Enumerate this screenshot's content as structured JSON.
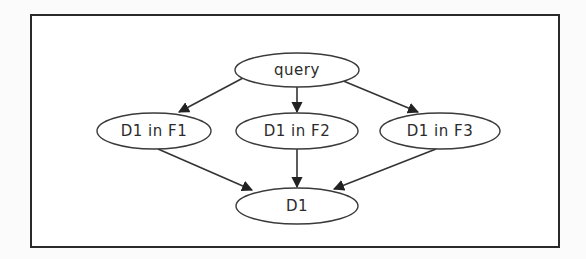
{
  "diagram": {
    "type": "directed-graph",
    "colors": {
      "frame": "#2a2a2a",
      "node_stroke": "#3a3a3a",
      "edge": "#333333",
      "text": "#2b2b2b",
      "background": "#ffffff"
    },
    "nodes": [
      {
        "id": "query",
        "label": "query",
        "cx": 297,
        "cy": 70,
        "rx": 62,
        "ry": 17
      },
      {
        "id": "d1_f1",
        "label": "D1 in F1",
        "cx": 154,
        "cy": 131,
        "rx": 57,
        "ry": 18
      },
      {
        "id": "d1_f2",
        "label": "D1 in F2",
        "cx": 297,
        "cy": 131,
        "rx": 61,
        "ry": 18
      },
      {
        "id": "d1_f3",
        "label": "D1 in F3",
        "cx": 440,
        "cy": 131,
        "rx": 60,
        "ry": 18
      },
      {
        "id": "d1",
        "label": "D1",
        "cx": 297,
        "cy": 206,
        "rx": 61,
        "ry": 18
      }
    ],
    "edges": [
      {
        "from": "query",
        "to": "d1_f1",
        "x1": 243,
        "y1": 78,
        "x2": 179,
        "y2": 112
      },
      {
        "from": "query",
        "to": "d1_f2",
        "x1": 297,
        "y1": 87,
        "x2": 297,
        "y2": 112
      },
      {
        "from": "query",
        "to": "d1_f3",
        "x1": 341,
        "y1": 80,
        "x2": 418,
        "y2": 112
      },
      {
        "from": "d1_f1",
        "to": "d1",
        "x1": 158,
        "y1": 149,
        "x2": 252,
        "y2": 190
      },
      {
        "from": "d1_f2",
        "to": "d1",
        "x1": 297,
        "y1": 149,
        "x2": 297,
        "y2": 187
      },
      {
        "from": "d1_f3",
        "to": "d1",
        "x1": 436,
        "y1": 149,
        "x2": 334,
        "y2": 189
      }
    ]
  }
}
